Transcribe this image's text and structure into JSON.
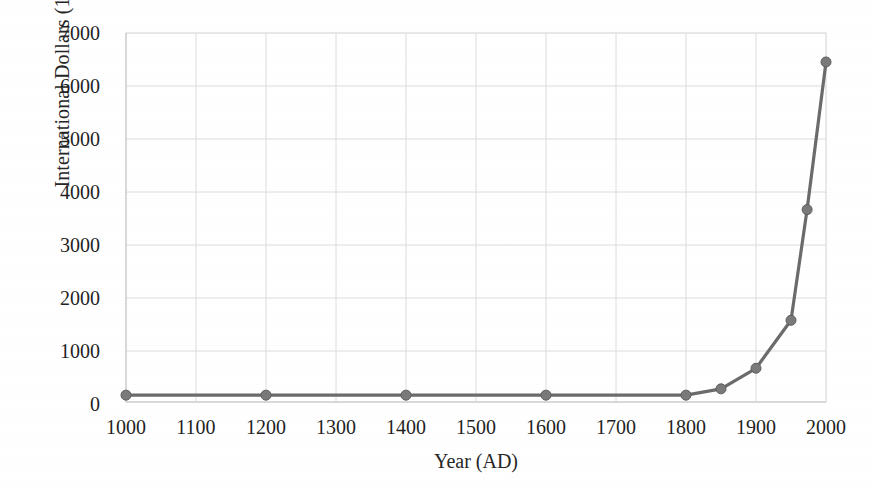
{
  "chart_data": {
    "type": "line",
    "title": "",
    "xlabel": "Year (AD)",
    "ylabel": "International Dollars (1990)",
    "xlim": [
      1000,
      2000
    ],
    "ylim": [
      0,
      7000
    ],
    "grid": true,
    "legend": "none",
    "marker": "filled-circle",
    "line_color": "#6b6b6b",
    "marker_color": "#7a7a7a",
    "xticks": [
      "1000",
      "1100",
      "1200",
      "1300",
      "1400",
      "1500",
      "1600",
      "1700",
      "1800",
      "1900",
      "2000"
    ],
    "yticks": [
      "0",
      "1000",
      "2000",
      "3000",
      "4000",
      "5000",
      "6000",
      "7000"
    ],
    "x": [
      1000,
      1200,
      1400,
      1600,
      1800,
      1850,
      1900,
      1950,
      1973,
      2000
    ],
    "y": [
      130,
      130,
      130,
      130,
      130,
      250,
      640,
      1550,
      3650,
      6450
    ],
    "series": [
      {
        "name": "World GDP per capita",
        "points": [
          {
            "x": 1000,
            "y": 130
          },
          {
            "x": 1200,
            "y": 130
          },
          {
            "x": 1400,
            "y": 130
          },
          {
            "x": 1600,
            "y": 130
          },
          {
            "x": 1800,
            "y": 130
          },
          {
            "x": 1850,
            "y": 250
          },
          {
            "x": 1900,
            "y": 640
          },
          {
            "x": 1950,
            "y": 1550
          },
          {
            "x": 1973,
            "y": 3650
          },
          {
            "x": 2000,
            "y": 6450
          }
        ]
      }
    ]
  },
  "axis": {
    "x_title": "Year (AD)",
    "y_title": "International Dollars (1990)"
  }
}
